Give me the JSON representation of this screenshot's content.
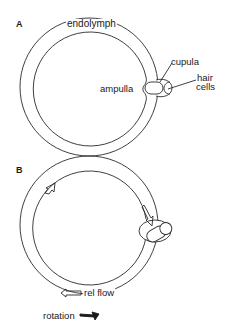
{
  "figure": {
    "panels": [
      {
        "id": "A",
        "label": "A",
        "labels": {
          "endolymph": "endolymph",
          "cupula": "cupula",
          "ampulla": "ampulla",
          "hair_cells_line1": "hair",
          "hair_cells_line2": "cells"
        }
      },
      {
        "id": "B",
        "label": "B",
        "labels": {
          "rel_flow": "rel flow",
          "rotation": "rotation"
        },
        "arrows": [
          "flow-arrow-top-left",
          "flow-arrow-right",
          "flow-arrow-bottom",
          "rotation-arrow"
        ]
      }
    ],
    "colors": {
      "line": "#2a2a2a",
      "background": "#ffffff"
    }
  }
}
